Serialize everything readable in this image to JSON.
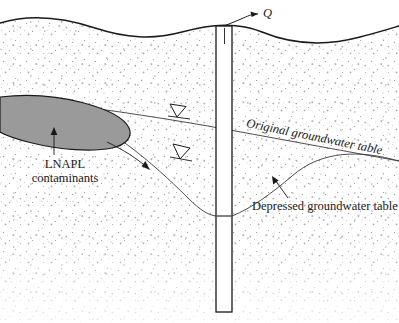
{
  "figure": {
    "colors": {
      "line": "#1a1a1a",
      "thin_line": "#3a3a3a",
      "plume_fill": "#9a9a9a",
      "plume_stroke": "#1a1a1a",
      "soil_stipple": "#8c8c8c",
      "background": "#ffffff",
      "well_fill": "#ffffff"
    }
  },
  "labels": {
    "pumping_rate": "Q",
    "original_water_table": "Original groundwater table",
    "depressed_water_table": "Depressed groundwater table",
    "contaminant_line1": "LNAPL",
    "contaminant_line2": "contaminants"
  },
  "elements": {
    "ground_surface": "ground-surface-line",
    "well": "pumping-well-casing",
    "plume": "lnapl-plume",
    "original_table_line": "original-groundwater-table-line",
    "depressed_table_curve": "depressed-groundwater-table-curve",
    "water_table_symbol": "water-table-triangle",
    "flow_arrow": "groundwater-flow-arrow",
    "soil": "soil-stipple-fill"
  }
}
